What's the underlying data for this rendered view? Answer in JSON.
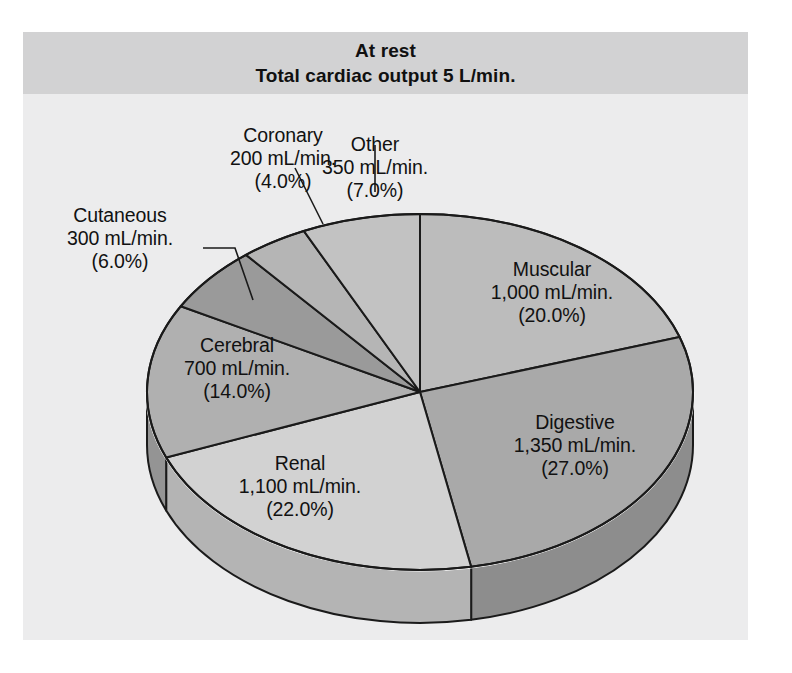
{
  "figure": {
    "background_color": "#ffffff",
    "plate_color": "#ececed",
    "title_band_color": "#d2d2d3"
  },
  "title": {
    "line1": "At rest",
    "line2": "Total cardiac output 5 L/min."
  },
  "chart_data": {
    "type": "pie",
    "subtitle": "Distribution of cardiac output to organ systems at rest",
    "unit": "mL/min.",
    "total_value": 5000,
    "total_label": "5 L/min.",
    "start_angle_deg": 0,
    "direction": "clockwise",
    "three_d": true,
    "legend": "none (labels on/around slices)",
    "categories": [
      "Muscular",
      "Digestive",
      "Renal",
      "Cerebral",
      "Cutaneous",
      "Coronary",
      "Other"
    ],
    "values": [
      1000,
      1350,
      1100,
      700,
      300,
      200,
      350
    ],
    "percentages": [
      20.0,
      27.0,
      22.0,
      14.0,
      6.0,
      4.0,
      7.0
    ],
    "slices": [
      {
        "name": "Muscular",
        "value": 1000,
        "value_label": "1,000 mL/min.",
        "percent": 20.0,
        "percent_label": "(20.0%)",
        "color": "#bcbcbc",
        "side_color": "#9c9c9c",
        "label_placement": "inside"
      },
      {
        "name": "Digestive",
        "value": 1350,
        "value_label": "1,350 mL/min.",
        "percent": 27.0,
        "percent_label": "(27.0%)",
        "color": "#a9a9a9",
        "side_color": "#8d8d8d",
        "label_placement": "inside"
      },
      {
        "name": "Renal",
        "value": 1100,
        "value_label": "1,100 mL/min.",
        "percent": 22.0,
        "percent_label": "(22.0%)",
        "color": "#d2d2d2",
        "side_color": "#b4b4b4",
        "label_placement": "inside"
      },
      {
        "name": "Cerebral",
        "value": 700,
        "value_label": "700 mL/min.",
        "percent": 14.0,
        "percent_label": "(14.0%)",
        "color": "#b0b0b0",
        "side_color": "#949494",
        "label_placement": "inside"
      },
      {
        "name": "Cutaneous",
        "value": 300,
        "value_label": "300 mL/min.",
        "percent": 6.0,
        "percent_label": "(6.0%)",
        "color": "#9a9a9a",
        "side_color": "#828282",
        "label_placement": "callout-left"
      },
      {
        "name": "Coronary",
        "value": 200,
        "value_label": "200 mL/min.",
        "percent": 4.0,
        "percent_label": "(4.0%)",
        "color": "#b5b5b5",
        "side_color": "#989898",
        "label_placement": "callout-top-left"
      },
      {
        "name": "Other",
        "value": 350,
        "value_label": "350 mL/min.",
        "percent": 7.0,
        "percent_label": "(7.0%)",
        "color": "#c2c2c2",
        "side_color": "#a2a2a2",
        "label_placement": "callout-top"
      }
    ]
  }
}
